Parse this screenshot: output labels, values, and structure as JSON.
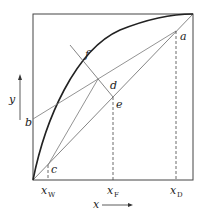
{
  "diagram": {
    "type": "McCabe-Thiele distillation diagram",
    "axes": {
      "x_label": "x",
      "y_label": "y"
    },
    "point_labels": {
      "a": "a",
      "b": "b",
      "c": "c",
      "d": "d",
      "e": "e",
      "f": "f"
    },
    "x_ticks": [
      {
        "main": "x",
        "sub": "W"
      },
      {
        "main": "x",
        "sub": "F"
      },
      {
        "main": "x",
        "sub": "D"
      }
    ],
    "colors": {
      "lines": "#333333",
      "equilibrium_curve": "#222222",
      "operating_lines": "#777777"
    }
  }
}
